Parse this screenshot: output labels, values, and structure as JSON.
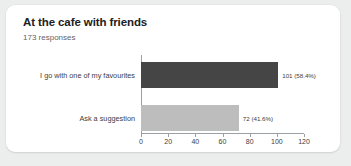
{
  "card": {
    "title": "At the cafe with friends",
    "response_count": "173 responses"
  },
  "colors": {
    "page_background": "#eceded",
    "card_background": "#ffffff",
    "bar_primary": "#454545",
    "bar_secondary": "#bdbdbd",
    "axis": "#9aa0a6",
    "title_text": "#202124",
    "body_text": "#3c4043",
    "muted_text": "#5f6368"
  },
  "chart_data": {
    "type": "bar",
    "orientation": "horizontal",
    "title": "At the cafe with friends",
    "subtitle": "173 responses",
    "xlabel": "",
    "ylabel": "",
    "xlim": [
      0,
      120
    ],
    "grid": false,
    "legend": "none",
    "total_responses": 173,
    "categories": [
      "I go with one of my favourites",
      "Ask a suggestion"
    ],
    "values": [
      101,
      72
    ],
    "percentages": [
      58.4,
      41.6
    ],
    "data_labels": [
      "101 (58.4%)",
      "72 (41.6%)"
    ],
    "bar_colors": [
      "#454545",
      "#bdbdbd"
    ],
    "xticks": [
      0,
      20,
      40,
      60,
      80,
      100,
      120
    ],
    "xtick_labels": [
      "0",
      "20",
      "40",
      "60",
      "80",
      "100",
      "120"
    ]
  }
}
